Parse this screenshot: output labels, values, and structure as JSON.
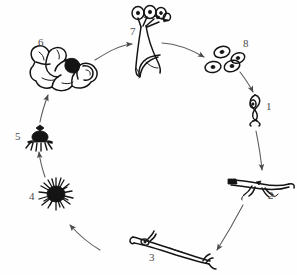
{
  "figure": {
    "background_color": "#fefefe",
    "ink_color": "#141414",
    "label_color": "#4a4a4a",
    "arrow_color": "#5d5d5d",
    "width": 297,
    "height": 275
  },
  "stages": [
    {
      "number": "1",
      "label_x": 266,
      "label_y": 108,
      "depiction": "germinating-spore-with-germ-tube",
      "center_x": 254,
      "center_y": 108
    },
    {
      "number": "2",
      "label_x": 268,
      "label_y": 197,
      "depiction": "branching-hypha",
      "center_x": 255,
      "center_y": 188
    },
    {
      "number": "3",
      "label_x": 149,
      "label_y": 259,
      "depiction": "elongated-hyphal-strand",
      "center_x": 165,
      "center_y": 245
    },
    {
      "number": "4",
      "label_x": 29,
      "label_y": 198,
      "depiction": "radial-mycelium-mass",
      "center_x": 55,
      "center_y": 194
    },
    {
      "number": "5",
      "label_x": 15,
      "label_y": 138,
      "depiction": "fruiting-body-primordium",
      "center_x": 40,
      "center_y": 140
    },
    {
      "number": "6",
      "label_x": 38,
      "label_y": 44,
      "depiction": "mature-lobed-fruiting-body",
      "center_x": 62,
      "center_y": 66
    },
    {
      "number": "7",
      "label_x": 130,
      "label_y": 33,
      "depiction": "sporangiophore-with-spore-heads",
      "center_x": 148,
      "center_y": 45
    },
    {
      "number": "8",
      "label_x": 243,
      "label_y": 45,
      "depiction": "released-oval-spores",
      "center_x": 222,
      "center_y": 62
    }
  ],
  "arrows": [
    {
      "from": "8",
      "to": "1",
      "name": "arrow-8-to-1"
    },
    {
      "from": "1",
      "to": "2",
      "name": "arrow-1-to-2"
    },
    {
      "from": "2",
      "to": "3",
      "name": "arrow-2-to-3"
    },
    {
      "from": "3",
      "to": "4",
      "name": "arrow-3-to-4"
    },
    {
      "from": "4",
      "to": "5",
      "name": "arrow-4-to-5"
    },
    {
      "from": "5",
      "to": "6",
      "name": "arrow-5-to-6"
    },
    {
      "from": "6",
      "to": "7",
      "name": "arrow-6-to-7"
    },
    {
      "from": "7",
      "to": "8",
      "name": "arrow-7-to-8"
    }
  ]
}
